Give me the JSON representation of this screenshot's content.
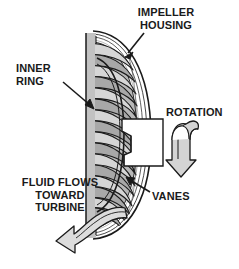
{
  "figure": {
    "kind": "technical-cutaway-diagram",
    "background_color": "#ffffff",
    "line_color": "#1a1a1a",
    "shade_color": "#b3b3b3",
    "light_shade_color": "#d9d9d9",
    "white_color": "#ffffff"
  },
  "labels": {
    "impeller_housing": {
      "line1": "IMPELLER",
      "line2": "HOUSING"
    },
    "inner_ring": {
      "line1": "INNER",
      "line2": "RING"
    },
    "rotation": {
      "line1": "ROTATION"
    },
    "fluid_flow": {
      "line1": "FLUID FLOWS",
      "line2": "TOWARD",
      "line3": "TURBINE"
    },
    "vanes": {
      "line1": "VANES"
    }
  },
  "parts": {
    "housing_shell": "impeller-housing-shell",
    "inner_ring": "inner-ring",
    "vanes": "impeller-vanes",
    "hub": "impeller-hub-boss",
    "rotation_arrow": "rotation-curved-arrow",
    "fluid_arrow": "fluid-flow-curved-arrow"
  }
}
